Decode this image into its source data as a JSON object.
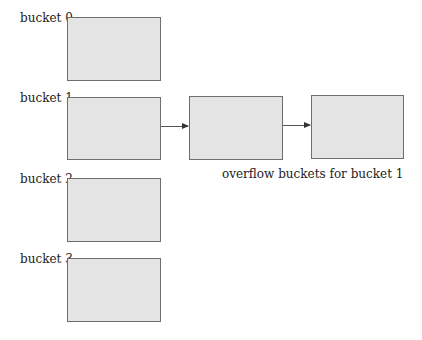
{
  "buckets": [
    {
      "label": "bucket 0"
    },
    {
      "label": "bucket 1"
    },
    {
      "label": "bucket 2"
    },
    {
      "label": "bucket 3"
    }
  ],
  "overflow": {
    "caption": "overflow  buckets for bucket 1",
    "count": 2
  },
  "colors": {
    "box_fill": "#e4e4e4",
    "box_border": "#6e6e6e",
    "arrow": "#333333"
  }
}
